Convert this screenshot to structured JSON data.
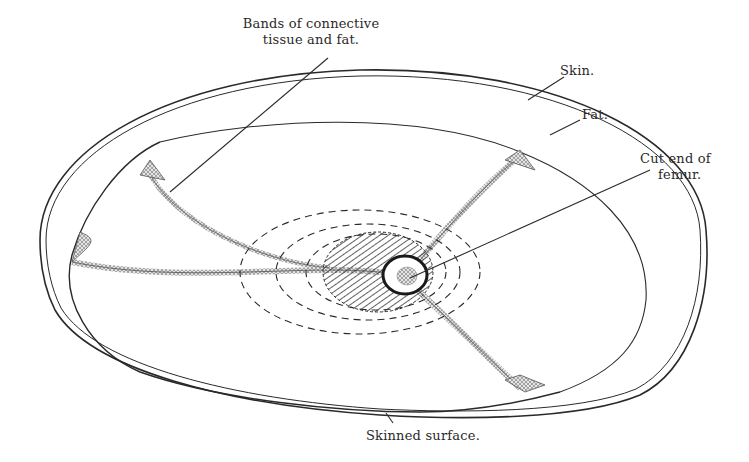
{
  "figure": {
    "type": "anatomical cross-section illustration",
    "colors": {
      "ink": "#2a2a2a",
      "background": "#ffffff",
      "hatch": "#3a3a3a",
      "band_fill": "#cfcfcf"
    },
    "labels": {
      "bands": {
        "line1": "Bands of connective",
        "line2": "tissue and fat."
      },
      "skin": "Skin.",
      "fat": "Fat.",
      "femur": {
        "line1": "Cut end of",
        "line2": "femur."
      },
      "skinned_surface": "Skinned surface."
    }
  }
}
